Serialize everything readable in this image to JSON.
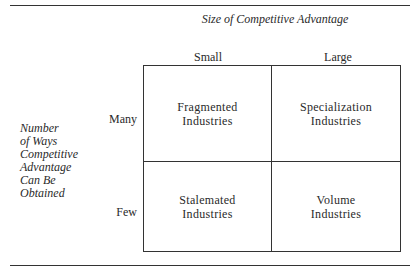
{
  "title": "Size of Competitive Advantage",
  "columns": [
    "Small",
    "Large"
  ],
  "rows": [
    "Many",
    "Few"
  ],
  "y_axis_label": [
    "Number",
    "of Ways",
    "Competitive",
    "Advantage",
    "Can Be",
    "Obtained"
  ],
  "cells": [
    [
      "Fragmented Industries",
      "Specialization Industries"
    ],
    [
      "Stalemated Industries",
      "Volume Industries"
    ]
  ],
  "cell_lines": {
    "fragmented": [
      "Fragmented",
      "Industries"
    ],
    "specialization": [
      "Specialization",
      "Industries"
    ],
    "stalemated": [
      "Stalemated",
      "Industries"
    ],
    "volume": [
      "Volume",
      "Industries"
    ]
  }
}
